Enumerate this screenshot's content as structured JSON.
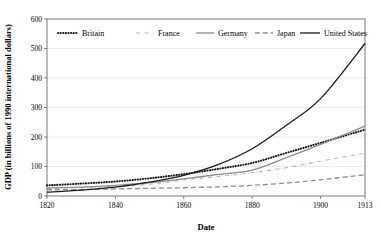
{
  "chart_data": {
    "type": "line",
    "title": "",
    "xlabel": "Date",
    "ylabel": "GDP (in billions of 1990 international dollars)",
    "xlim": [
      1820,
      1913
    ],
    "ylim": [
      0,
      600
    ],
    "yticks": [
      0,
      100,
      200,
      300,
      400,
      500,
      600
    ],
    "ytick_labels": [
      "0",
      "100",
      "200",
      "300",
      "400",
      "500",
      "600"
    ],
    "xticks": [
      1820,
      1840,
      1860,
      1880,
      1900,
      1913
    ],
    "xtick_labels": [
      "1820",
      "1840",
      "1860",
      "1880",
      "1900",
      "1913"
    ],
    "grid": "horizontal",
    "legend_position": "top-inside",
    "x": [
      1820,
      1830,
      1840,
      1850,
      1860,
      1870,
      1880,
      1890,
      1900,
      1913
    ],
    "series": [
      {
        "name": "Britain",
        "style": "dotted",
        "color": "#1a1a1a",
        "values": [
          36,
          42,
          49,
          60,
          74,
          92,
          112,
          146,
          180,
          225
        ]
      },
      {
        "name": "France",
        "style": "dash-dot",
        "color": "#b5b5b5",
        "values": [
          26,
          29,
          33,
          40,
          54,
          66,
          79,
          96,
          118,
          145
        ]
      },
      {
        "name": "Germany",
        "style": "solid",
        "color": "#8c8c8c",
        "values": [
          27,
          30,
          36,
          45,
          58,
          73,
          88,
          130,
          175,
          237
        ]
      },
      {
        "name": "Japan",
        "style": "long-dash",
        "color": "#8c8c8c",
        "values": [
          21,
          22,
          24,
          26,
          28,
          31,
          36,
          44,
          55,
          72
        ]
      },
      {
        "name": "United States",
        "style": "solid",
        "color": "#1a1a1a",
        "values": [
          13,
          20,
          30,
          47,
          70,
          106,
          160,
          240,
          330,
          517
        ]
      }
    ]
  },
  "legend": {
    "items": [
      {
        "label": "Britain"
      },
      {
        "label": "France"
      },
      {
        "label": "Germany"
      },
      {
        "label": "Japan"
      },
      {
        "label": "United States"
      }
    ]
  }
}
